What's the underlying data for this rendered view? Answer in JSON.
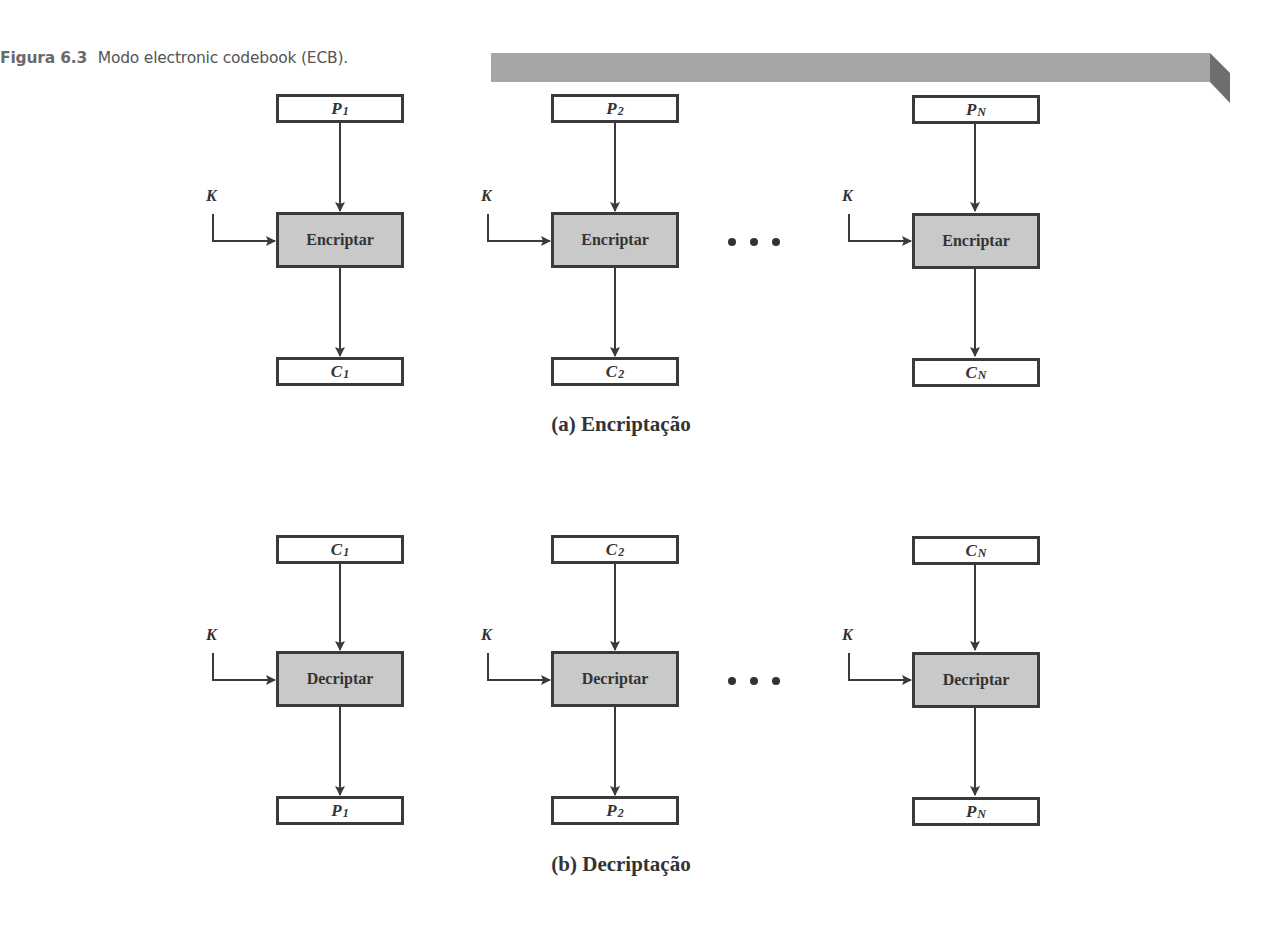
{
  "figure": {
    "number": "Figura 6.3",
    "title": "Modo electronic codebook (ECB).",
    "banner_color": "#a6a6a6",
    "banner_fold_color": "#6e6e6e"
  },
  "encryption": {
    "title": "(a) Encriptação",
    "key_label": "K",
    "operation_label": "Encriptar",
    "columns": [
      {
        "input": {
          "base": "P",
          "sub": "1"
        },
        "output": {
          "base": "C",
          "sub": "1"
        }
      },
      {
        "input": {
          "base": "P",
          "sub": "2"
        },
        "output": {
          "base": "C",
          "sub": "2"
        }
      },
      {
        "input": {
          "base": "P",
          "sub": "N"
        },
        "output": {
          "base": "C",
          "sub": "N"
        }
      }
    ],
    "ellipsis": "• • •"
  },
  "decryption": {
    "title": "(b) Decriptação",
    "key_label": "K",
    "operation_label": "Decriptar",
    "columns": [
      {
        "input": {
          "base": "C",
          "sub": "1"
        },
        "output": {
          "base": "P",
          "sub": "1"
        }
      },
      {
        "input": {
          "base": "C",
          "sub": "2"
        },
        "output": {
          "base": "P",
          "sub": "2"
        }
      },
      {
        "input": {
          "base": "C",
          "sub": "N"
        },
        "output": {
          "base": "P",
          "sub": "N"
        }
      }
    ],
    "ellipsis": "• • •"
  },
  "colors": {
    "block_fill": "#c9c9c9",
    "stroke": "#3a3a3a"
  }
}
